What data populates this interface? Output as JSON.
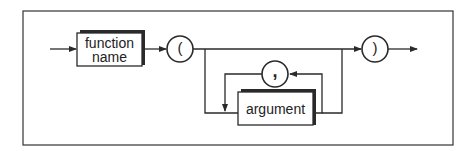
{
  "diagram": {
    "type": "syntax-railroad",
    "nodes": {
      "function_name": {
        "label_line1": "function",
        "label_line2": "name",
        "kind": "nonterminal"
      },
      "open_paren": {
        "label": "(",
        "kind": "terminal"
      },
      "comma": {
        "label": ",",
        "kind": "terminal"
      },
      "argument": {
        "label": "argument",
        "kind": "nonterminal"
      },
      "close_paren": {
        "label": ")",
        "kind": "terminal"
      }
    },
    "edges": [
      [
        "start",
        "function_name"
      ],
      [
        "function_name",
        "open_paren"
      ],
      [
        "open_paren",
        "close_paren"
      ],
      [
        "open_paren",
        "argument"
      ],
      [
        "argument",
        "comma"
      ],
      [
        "comma",
        "argument"
      ],
      [
        "argument",
        "close_paren"
      ],
      [
        "close_paren",
        "end"
      ]
    ],
    "colors": {
      "line": "#2a2a2a",
      "background": "#ffffff"
    }
  }
}
